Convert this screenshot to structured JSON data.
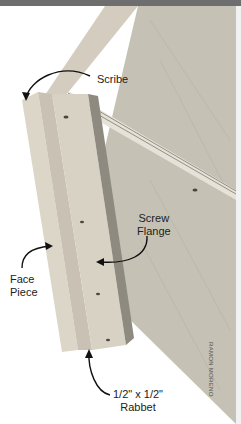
{
  "image": {
    "description": "Photograph of plywood cabinet side with attached face frame piece, annotated with labels",
    "colors": {
      "top_bar": "#6e6e6e",
      "plywood": "#c9c4b8",
      "face_piece": "#d7d1c4",
      "shadow": "#8f8a80",
      "label_text": "#222222"
    }
  },
  "labels": {
    "scribe": "Scribe",
    "screw_flange_line1": "Screw",
    "screw_flange_line2": "Flange",
    "face_piece_line1": "Face",
    "face_piece_line2": "Piece",
    "rabbet_line1": "1/2\" x 1/2\"",
    "rabbet_line2": "Rabbet"
  },
  "credit": "RAMON MORENO"
}
